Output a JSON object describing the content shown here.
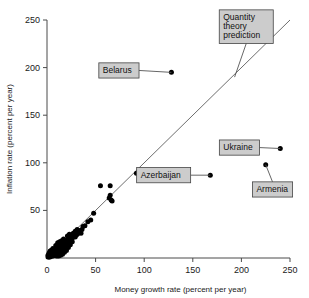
{
  "chart_data": {
    "type": "scatter",
    "title": "",
    "xlabel": "Money growth rate (percent per year)",
    "ylabel": "Inflation rate (percent per year)",
    "xlim": [
      0,
      250
    ],
    "ylim": [
      0,
      250
    ],
    "xticks": [
      0,
      50,
      100,
      150,
      200,
      250
    ],
    "yticks": [
      0,
      50,
      100,
      150,
      200,
      250
    ],
    "xtick_labels": [
      "0",
      "50",
      "100",
      "150",
      "200",
      "250"
    ],
    "ytick_labels": [
      "0",
      "50",
      "100",
      "150",
      "200",
      "250"
    ],
    "grid": false,
    "legend": "none",
    "reference_line": {
      "name": "Quantity theory prediction",
      "type": "identity",
      "slope": 1,
      "intercept": 0,
      "x_range": [
        0,
        250
      ]
    },
    "annotations": [
      {
        "label": "Belarus",
        "x": 128,
        "y": 195,
        "box_x": 74,
        "box_y": 197
      },
      {
        "label": "Quantity\ntheory\nprediction",
        "x": 193,
        "y": 190,
        "box_x": 205,
        "box_y": 243
      },
      {
        "label": "Ukraine",
        "x": 240,
        "y": 115,
        "box_x": 198,
        "box_y": 116
      },
      {
        "label": "Armenia",
        "x": 225,
        "y": 98,
        "box_x": 232,
        "box_y": 72
      },
      {
        "label": "Azerbaijan",
        "x": 168,
        "y": 87,
        "box_x": 120,
        "box_y": 87
      }
    ],
    "points": [
      {
        "x": 128,
        "y": 195,
        "label": "Belarus"
      },
      {
        "x": 240,
        "y": 115,
        "label": "Ukraine"
      },
      {
        "x": 225,
        "y": 98,
        "label": "Armenia"
      },
      {
        "x": 168,
        "y": 87,
        "label": "Azerbaijan"
      },
      {
        "x": 92,
        "y": 89
      },
      {
        "x": 55,
        "y": 76
      },
      {
        "x": 65,
        "y": 76
      },
      {
        "x": 65,
        "y": 66
      },
      {
        "x": 64,
        "y": 63
      },
      {
        "x": 66,
        "y": 61
      },
      {
        "x": 67,
        "y": 60
      },
      {
        "x": 48,
        "y": 47
      },
      {
        "x": 45,
        "y": 40
      },
      {
        "x": 42,
        "y": 38
      },
      {
        "x": 39,
        "y": 34
      },
      {
        "x": 37,
        "y": 33
      },
      {
        "x": 36,
        "y": 30
      },
      {
        "x": 34,
        "y": 29
      },
      {
        "x": 33,
        "y": 27
      },
      {
        "x": 32,
        "y": 26
      },
      {
        "x": 31,
        "y": 25
      },
      {
        "x": 30,
        "y": 24
      },
      {
        "x": 29,
        "y": 28
      },
      {
        "x": 28,
        "y": 23
      },
      {
        "x": 28,
        "y": 26
      },
      {
        "x": 27,
        "y": 22
      },
      {
        "x": 26,
        "y": 21
      },
      {
        "x": 26,
        "y": 24
      },
      {
        "x": 25,
        "y": 20
      },
      {
        "x": 25,
        "y": 23
      },
      {
        "x": 24,
        "y": 19
      },
      {
        "x": 24,
        "y": 22
      },
      {
        "x": 23,
        "y": 18
      },
      {
        "x": 23,
        "y": 21
      },
      {
        "x": 22,
        "y": 17
      },
      {
        "x": 22,
        "y": 20
      },
      {
        "x": 21,
        "y": 16
      },
      {
        "x": 21,
        "y": 19
      },
      {
        "x": 20,
        "y": 15
      },
      {
        "x": 20,
        "y": 18
      },
      {
        "x": 20,
        "y": 12
      },
      {
        "x": 19,
        "y": 14
      },
      {
        "x": 19,
        "y": 17
      },
      {
        "x": 19,
        "y": 11
      },
      {
        "x": 18,
        "y": 13
      },
      {
        "x": 18,
        "y": 16
      },
      {
        "x": 18,
        "y": 10
      },
      {
        "x": 17,
        "y": 12
      },
      {
        "x": 17,
        "y": 15
      },
      {
        "x": 17,
        "y": 9
      },
      {
        "x": 16,
        "y": 11
      },
      {
        "x": 16,
        "y": 14
      },
      {
        "x": 16,
        "y": 8
      },
      {
        "x": 15,
        "y": 10
      },
      {
        "x": 15,
        "y": 13
      },
      {
        "x": 15,
        "y": 7
      },
      {
        "x": 14,
        "y": 9
      },
      {
        "x": 14,
        "y": 12
      },
      {
        "x": 14,
        "y": 6
      },
      {
        "x": 13,
        "y": 8
      },
      {
        "x": 13,
        "y": 11
      },
      {
        "x": 13,
        "y": 5
      },
      {
        "x": 12,
        "y": 7
      },
      {
        "x": 12,
        "y": 10
      },
      {
        "x": 12,
        "y": 4
      },
      {
        "x": 11,
        "y": 6
      },
      {
        "x": 11,
        "y": 9
      },
      {
        "x": 11,
        "y": 13
      },
      {
        "x": 10,
        "y": 5
      },
      {
        "x": 10,
        "y": 8
      },
      {
        "x": 10,
        "y": 11
      },
      {
        "x": 9,
        "y": 4
      },
      {
        "x": 9,
        "y": 7
      },
      {
        "x": 9,
        "y": 10
      },
      {
        "x": 8,
        "y": 3
      },
      {
        "x": 8,
        "y": 6
      },
      {
        "x": 8,
        "y": 9
      },
      {
        "x": 7,
        "y": 3
      },
      {
        "x": 7,
        "y": 5
      },
      {
        "x": 7,
        "y": 8
      },
      {
        "x": 6,
        "y": 2
      },
      {
        "x": 6,
        "y": 5
      },
      {
        "x": 6,
        "y": 7
      },
      {
        "x": 5,
        "y": 2
      },
      {
        "x": 5,
        "y": 4
      },
      {
        "x": 5,
        "y": 6
      },
      {
        "x": 4,
        "y": 2
      },
      {
        "x": 4,
        "y": 4
      },
      {
        "x": 4,
        "y": 6
      },
      {
        "x": 3,
        "y": 1
      },
      {
        "x": 3,
        "y": 3
      },
      {
        "x": 3,
        "y": 5
      },
      {
        "x": 2,
        "y": 1
      },
      {
        "x": 2,
        "y": 3
      },
      {
        "x": 2,
        "y": 5
      },
      {
        "x": 1,
        "y": 1
      },
      {
        "x": 1,
        "y": 3
      },
      {
        "x": 21,
        "y": 23
      },
      {
        "x": 23,
        "y": 25
      },
      {
        "x": 27,
        "y": 26
      },
      {
        "x": 30,
        "y": 28
      },
      {
        "x": 35,
        "y": 26
      },
      {
        "x": 31,
        "y": 30
      },
      {
        "x": 29,
        "y": 22
      },
      {
        "x": 26,
        "y": 17
      },
      {
        "x": 24,
        "y": 14
      },
      {
        "x": 22,
        "y": 11
      },
      {
        "x": 20,
        "y": 8
      },
      {
        "x": 18,
        "y": 6
      },
      {
        "x": 16,
        "y": 4
      },
      {
        "x": 14,
        "y": 3
      },
      {
        "x": 12,
        "y": 2
      },
      {
        "x": 10,
        "y": 2
      },
      {
        "x": 9,
        "y": 13
      },
      {
        "x": 11,
        "y": 16
      },
      {
        "x": 13,
        "y": 17
      },
      {
        "x": 15,
        "y": 18
      },
      {
        "x": 17,
        "y": 20
      },
      {
        "x": 6,
        "y": 10
      },
      {
        "x": 5,
        "y": 8
      },
      {
        "x": 4,
        "y": 8
      },
      {
        "x": 3,
        "y": 7
      }
    ]
  },
  "colors": {
    "point": "#000000",
    "line": "#6e6e6e",
    "axis": "#4a4a4a",
    "label_box": "#cccccc",
    "label_border": "#444444",
    "text": "#111111"
  }
}
